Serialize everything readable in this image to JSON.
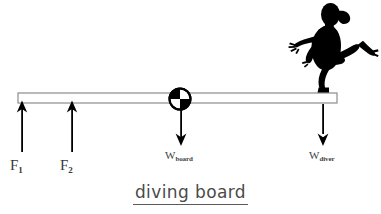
{
  "figure": {
    "caption": "diving board",
    "background_color": "#ffffff",
    "ink_color": "#000000",
    "board": {
      "name": "diving board",
      "fill_color": "#ffffff",
      "stroke_color": "#808080",
      "x_start": 18,
      "x_end": 337,
      "y_top": 93,
      "y_bottom": 103
    },
    "pivot": {
      "name": "center of mass marker",
      "cx": 180,
      "cy": 99,
      "radius": 11,
      "quadrant_colors": [
        "#000000",
        "#ffffff",
        "#ffffff",
        "#000000"
      ]
    },
    "diver": {
      "name": "diver silhouette",
      "color": "#000000",
      "pose": "running off the end of the board"
    },
    "forces": [
      {
        "id": "F1",
        "label": "F",
        "subscript": "1",
        "direction": "up",
        "x": 22,
        "tail_y": 152,
        "head_y": 101,
        "label_x": 10,
        "label_y": 160
      },
      {
        "id": "F2",
        "label": "F",
        "subscript": "2",
        "direction": "up",
        "x": 72,
        "tail_y": 152,
        "head_y": 101,
        "label_x": 60,
        "label_y": 160
      },
      {
        "id": "Wboard",
        "label": "W",
        "subscript": "board",
        "direction": "down",
        "x": 181,
        "tail_y": 108,
        "head_y": 146,
        "label_x": 164,
        "label_y": 150
      },
      {
        "id": "Wdiver",
        "label": "W",
        "subscript": "diver",
        "direction": "down",
        "x": 323,
        "tail_y": 104,
        "head_y": 146,
        "label_x": 308,
        "label_y": 150
      }
    ]
  }
}
